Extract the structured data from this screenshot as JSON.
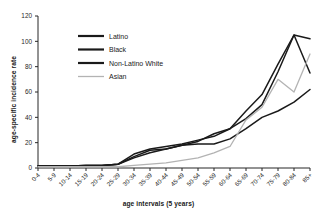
{
  "axes": {
    "xlabel": "age intervals (5 years)",
    "ylabel": "age-specific incidence rate"
  },
  "colors": {
    "dark": "#1a1a1a",
    "mid": "#333333",
    "gray": "#b3b3b3",
    "axis": "#262626"
  },
  "chart_data": {
    "type": "line",
    "title": "",
    "xlabel": "age intervals (5 years)",
    "ylabel": "age-specific incidence rate",
    "categories": [
      "0-4",
      "5-9",
      "10-14",
      "15-19",
      "20-24",
      "25-29",
      "30-34",
      "35-39",
      "40-44",
      "45-49",
      "50-54",
      "55-59",
      "60-64",
      "65-69",
      "70-74",
      "75-79",
      "80-84",
      "85+"
    ],
    "yticks": [
      0,
      20,
      40,
      60,
      80,
      100,
      120
    ],
    "ylim": [
      0,
      120
    ],
    "grid": false,
    "legend_position": "upper-left-inside",
    "series": [
      {
        "name": "Latino",
        "color": "#1a1a1a",
        "values": [
          1.5,
          1.5,
          1.5,
          2,
          2,
          3,
          9,
          14,
          15,
          18,
          19,
          19,
          23,
          31,
          40,
          45,
          52,
          62
        ]
      },
      {
        "name": "Black",
        "color": "#1a1a1a",
        "values": [
          1.5,
          1.5,
          1.5,
          2,
          2,
          3,
          11,
          15,
          17,
          19,
          22,
          25,
          31,
          39,
          50,
          76,
          105,
          75
        ]
      },
      {
        "name": "Non-Latino White",
        "color": "#1a1a1a",
        "values": [
          1.5,
          1.5,
          1.5,
          2,
          2,
          3,
          8,
          12,
          15,
          18,
          21,
          27,
          31,
          45,
          58,
          82,
          105,
          102
        ]
      },
      {
        "name": "Asian",
        "color": "#b3b3b3",
        "values": [
          1,
          1,
          1,
          1,
          1,
          1,
          2,
          3,
          4,
          6,
          8,
          12,
          17,
          38,
          48,
          70,
          60,
          90
        ]
      }
    ]
  },
  "legend": {
    "items": [
      {
        "label": "Latino",
        "color": "#1a1a1a"
      },
      {
        "label": "Black",
        "color": "#1a1a1a"
      },
      {
        "label": "Non-Latino White",
        "color": "#1a1a1a"
      },
      {
        "label": "Asian",
        "color": "#b3b3b3"
      }
    ]
  }
}
